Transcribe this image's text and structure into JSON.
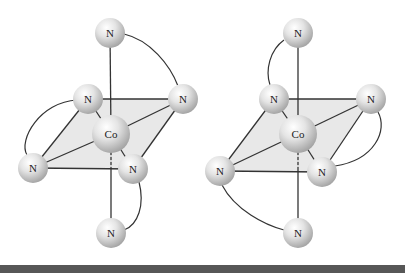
{
  "figure": {
    "colors": {
      "plane_fill": "#e6e6e6",
      "bond": "#333333",
      "atom_light": "#fafafa",
      "atom_dark": "#a9a9a9",
      "bottom_bar": "#575757"
    },
    "molecules": [
      {
        "id": "left",
        "metal": {
          "label": "Co",
          "x": 111,
          "y": 134,
          "r": 19
        },
        "ligands": [
          {
            "label": "N",
            "pos": "top",
            "x": 110,
            "y": 33
          },
          {
            "label": "N",
            "pos": "upper-left",
            "x": 88,
            "y": 99
          },
          {
            "label": "N",
            "pos": "upper-right",
            "x": 183,
            "y": 99
          },
          {
            "label": "N",
            "pos": "lower-left",
            "x": 33,
            "y": 168
          },
          {
            "label": "N",
            "pos": "lower-right",
            "x": 133,
            "y": 169
          },
          {
            "label": "N",
            "pos": "bottom",
            "x": 111,
            "y": 233
          }
        ],
        "chelates": [
          [
            "top",
            "upper-right"
          ],
          [
            "upper-left",
            "lower-left"
          ],
          [
            "lower-right",
            "bottom"
          ]
        ]
      },
      {
        "id": "right",
        "metal": {
          "label": "Co",
          "x": 298,
          "y": 134,
          "r": 19
        },
        "ligands": [
          {
            "label": "N",
            "pos": "top",
            "x": 298,
            "y": 33
          },
          {
            "label": "N",
            "pos": "upper-left",
            "x": 274,
            "y": 99
          },
          {
            "label": "N",
            "pos": "upper-right",
            "x": 371,
            "y": 99
          },
          {
            "label": "N",
            "pos": "lower-left",
            "x": 220,
            "y": 171
          },
          {
            "label": "N",
            "pos": "lower-right",
            "x": 322,
            "y": 172
          },
          {
            "label": "N",
            "pos": "bottom",
            "x": 298,
            "y": 233
          }
        ],
        "chelates": [
          [
            "top",
            "upper-left"
          ],
          [
            "upper-right",
            "lower-right"
          ],
          [
            "lower-left",
            "bottom"
          ]
        ]
      }
    ]
  }
}
